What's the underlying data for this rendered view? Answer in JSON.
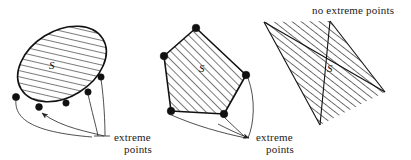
{
  "figure": {
    "width": 411,
    "height": 160,
    "background": "#ffffff",
    "ink_color": "#111111",
    "hatch_color": "#333333"
  },
  "panels": [
    {
      "id": "ellipse-panel",
      "shape": "ellipse",
      "set_label": "S",
      "caption": "extreme points",
      "caption_line1": "extreme",
      "caption_line2": "points",
      "extreme_point_count": 5,
      "note": "every boundary point of a strictly convex set is extreme"
    },
    {
      "id": "polygon-panel",
      "shape": "pentagon",
      "set_label": "S",
      "caption": "extreme points",
      "caption_line1": "extreme",
      "caption_line2": "points",
      "extreme_point_count": 5,
      "note": "the vertices of a polygon are its extreme points"
    },
    {
      "id": "strip-panel",
      "shape": "strip",
      "set_label": "S",
      "caption": "no extreme points",
      "caption_line1": "no extreme points",
      "extreme_point_count": 0,
      "note": "an unbounded slab has no extreme points"
    }
  ],
  "labels": {
    "set_symbol": "S",
    "extreme_word": "extreme",
    "points_word": "points",
    "no_extreme_points": "no extreme points"
  }
}
